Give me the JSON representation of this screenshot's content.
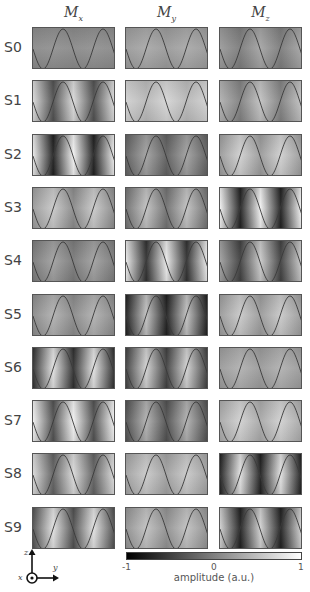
{
  "columns": [
    {
      "symbol": "M",
      "sub": "x"
    },
    {
      "symbol": "M",
      "sub": "y"
    },
    {
      "symbol": "M",
      "sub": "z"
    }
  ],
  "rows": [
    "S0",
    "S1",
    "S2",
    "S3",
    "S4",
    "S5",
    "S6",
    "S7",
    "S8",
    "S9"
  ],
  "panels": [
    [
      "#8a8a8a,#909090,#8a8a8a,#909090,#8a8a8a",
      "#9a9a9a,#a8a8a8,#9a9a9a,#a8a8a8,#9a9a9a",
      "#9a9a9a,#7c7c7c,#a4a4a4,#7c7c7c,#a4a4a4"
    ],
    [
      "#d8d8d8,#505050,#d8d8d8,#505050,#d8d8d8",
      "#d0d0d0,#b8b8b8,#d4d4d4,#b8b8b8,#d0d0d0",
      "#b0b0b0,#808080,#c0c0c0,#808080,#c0c0c0"
    ],
    [
      "#e8e8e8,#202020,#f0f0f0,#202020,#e8e8e8",
      "#606060,#a0a0a0,#606060,#a0a0a0,#606060",
      "#9a9a9a,#cfcfcf,#9a9a9a,#cfcfcf,#9a9a9a"
    ],
    [
      "#9a9a9a,#c8c8c8,#8a8a8a,#c8c8c8,#8a8a8a",
      "#707070,#c0c0c0,#707070,#c0c0c0,#707070",
      "#f0f0f0,#202020,#f0f0f0,#202020,#f0f0f0"
    ],
    [
      "#7a7a7a,#a0a0a0,#7a7a7a,#a0a0a0,#7a7a7a",
      "#e8e8e8,#303030,#e8e8e8,#303030,#e8e8e8",
      "#a0a0a0,#404040,#c8c8c8,#404040,#c8c8c8"
    ],
    [
      "#8a8a8a,#b0b0b0,#8a8a8a,#b0b0b0,#8a8a8a",
      "#202020,#c0c0c0,#202020,#c0c0c0,#202020",
      "#9a9a9a,#c8c8c8,#9a9a9a,#c8c8c8,#9a9a9a"
    ],
    [
      "#303030,#e0e0e0,#303030,#e0e0e0,#303030",
      "#404040,#d0d0d0,#404040,#d0d0d0,#404040",
      "#9a9a9a,#b0b0b0,#9a9a9a,#b0b0b0,#9a9a9a"
    ],
    [
      "#f0f0f0,#505050,#f0f0f0,#505050,#f0f0f0",
      "#505050,#b0b0b0,#505050,#b0b0b0,#505050",
      "#a8a8a8,#d0d0d0,#a8a8a8,#d0d0d0,#a8a8a8"
    ],
    [
      "#d8d8d8,#606060,#d8d8d8,#606060,#d8d8d8",
      "#a0a0a0,#c8c8c8,#a0a0a0,#c8c8c8,#a0a0a0",
      "#202020,#e0e0e0,#202020,#e0e0e0,#202020"
    ],
    [
      "#505050,#e0e0e0,#505050,#e0e0e0,#505050",
      "#909090,#c0c0c0,#909090,#c0c0c0,#909090",
      "#d0d0d0,#202020,#d0d0d0,#202020,#d0d0d0"
    ]
  ],
  "colorbar": {
    "min_label": "-1",
    "mid_label": "0",
    "max_label": "1",
    "label": "amplitude (a.u.)",
    "colors": [
      "#000000",
      "#ffffff"
    ]
  },
  "axes_icon": {
    "x": "x",
    "y": "y",
    "z": "z"
  }
}
